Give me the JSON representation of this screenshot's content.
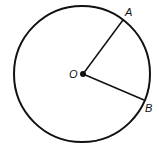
{
  "diagram": {
    "type": "circle-with-radii",
    "circle": {
      "cx": 82,
      "cy": 74,
      "r": 68,
      "stroke": "#111111",
      "stroke_width": 2
    },
    "center": {
      "label": "O",
      "x": 83,
      "y": 74,
      "label_x": 69,
      "label_y": 78
    },
    "points": [
      {
        "label": "A",
        "x": 123,
        "y": 20,
        "label_x": 125,
        "label_y": 16
      },
      {
        "label": "B",
        "x": 144,
        "y": 100,
        "label_x": 145,
        "label_y": 112
      }
    ],
    "segments": [
      {
        "from": "O",
        "to": "A"
      },
      {
        "from": "O",
        "to": "B"
      }
    ]
  }
}
